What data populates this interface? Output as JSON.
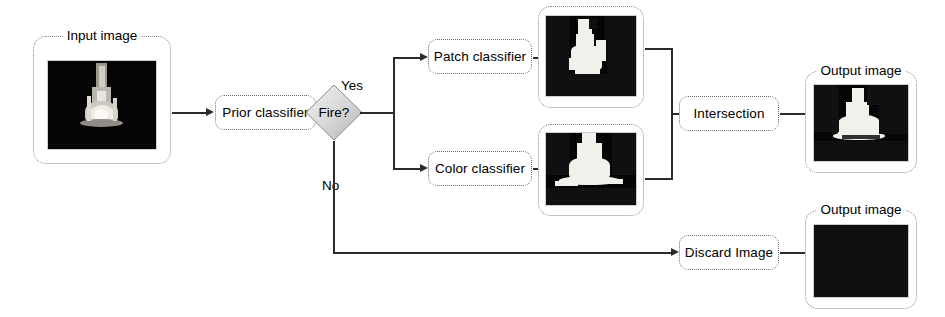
{
  "diagram": {
    "accent_color": "#2b2b2b",
    "panel_border_color": "#8a8a8a",
    "box_border_color": "#6d6d6d"
  },
  "panels": {
    "input": {
      "caption": "Input image",
      "kind": "grayscale-flame-photo"
    },
    "patch_result": {
      "caption": "",
      "kind": "binary-mask-patch"
    },
    "color_result": {
      "caption": "",
      "kind": "binary-mask-color"
    },
    "output_top": {
      "caption": "Output image",
      "kind": "binary-mask-intersection"
    },
    "output_bottom": {
      "caption": "Output image",
      "kind": "all-black"
    }
  },
  "nodes": {
    "prior_classifier": "Prior classifier",
    "decision": "Fire?",
    "patch_classifier": "Patch classifier",
    "color_classifier": "Color classifier",
    "intersection": "Intersection",
    "discard": "Discard Image"
  },
  "edges": {
    "yes": "Yes",
    "no": "No"
  }
}
